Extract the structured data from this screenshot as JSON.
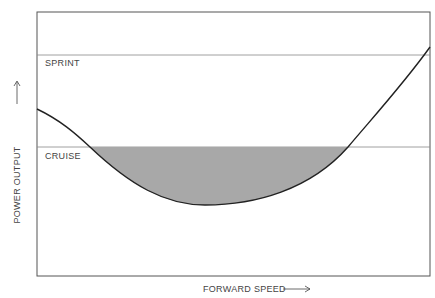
{
  "diagram": {
    "levels": [
      {
        "name": "sprint",
        "label": "SPRINT"
      },
      {
        "name": "cruise",
        "label": "CRUISE"
      }
    ],
    "x_axis_label": "FORWARD SPEED",
    "y_axis_label": "POWER OUTPUT",
    "curve": "U-shaped power curve vs speed; region below cruise line shaded",
    "colors": {
      "frame": "#555555",
      "curve": "#222222",
      "shade": "#a8a8a8",
      "levels": "#888888"
    }
  }
}
